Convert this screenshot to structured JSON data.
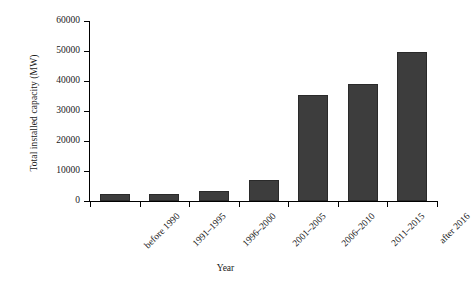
{
  "chart_data": {
    "type": "bar",
    "title": "",
    "subtitle": "",
    "xlabel": "Year",
    "ylabel": "Total installed capacity (MW)",
    "categories": [
      "before 1990",
      "1991–1995",
      "1996–2000",
      "2001–2005",
      "2006–2010",
      "2011–2015",
      "after 2016"
    ],
    "values": [
      2200,
      2200,
      3500,
      7000,
      35500,
      39000,
      49800
    ],
    "series": [
      {
        "name": "Total installed capacity (MW)",
        "values": [
          2200,
          2200,
          3500,
          7000,
          35500,
          39000,
          49800
        ]
      }
    ],
    "ylim": [
      0,
      60000
    ],
    "ytick_labels": [
      "0",
      "10000",
      "20000",
      "30000",
      "40000",
      "50000",
      "60000"
    ],
    "ytick_values": [
      0,
      10000,
      20000,
      30000,
      40000,
      50000,
      60000
    ],
    "grid": false,
    "legend": false,
    "legend_position": "none",
    "bar_color": "#3d3d3d",
    "axis_color": "#000000",
    "background_color": "#ffffff",
    "xtick_label_rotation": 45
  }
}
